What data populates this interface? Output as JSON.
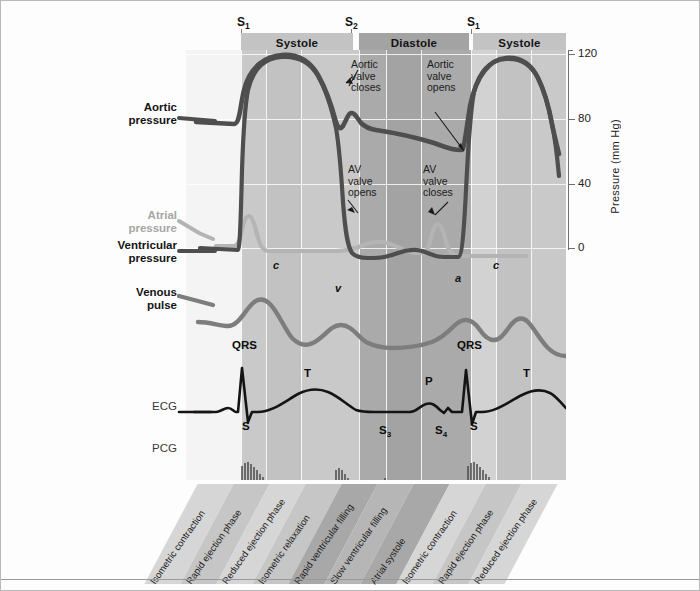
{
  "figure": {
    "axis": {
      "label": "Pressure (mm Hg)",
      "ticks": [
        "120",
        "80",
        "40",
        "0"
      ],
      "tick_values": [
        120,
        80,
        40,
        0
      ],
      "min": 0,
      "max": 120
    },
    "heart_sounds": [
      {
        "label": "S",
        "sub": "1",
        "x": 240
      },
      {
        "label": "S",
        "sub": "2",
        "x": 348
      },
      {
        "label": "S",
        "sub": "1",
        "x": 470
      }
    ],
    "phase_bar": [
      {
        "label": "Systole",
        "type": "systole",
        "x": 240,
        "w": 112
      },
      {
        "label": "Diastole",
        "type": "diastole",
        "x": 358,
        "w": 110
      },
      {
        "label": "Systole",
        "type": "systole",
        "x": 472,
        "w": 93
      }
    ],
    "traces": [
      {
        "name": "Aortic pressure",
        "label_lines": [
          "Aortic",
          "pressure"
        ],
        "style": "bold"
      },
      {
        "name": "Atrial pressure",
        "label_lines": [
          "Atrial",
          "pressure"
        ],
        "style": "muted"
      },
      {
        "name": "Ventricular pressure",
        "label_lines": [
          "Ventricular",
          "pressure"
        ],
        "style": "bold"
      },
      {
        "name": "Venous pulse",
        "label_lines": [
          "Venous",
          "pulse"
        ],
        "style": "bold"
      },
      {
        "name": "ECG",
        "label_lines": [
          "ECG"
        ],
        "style": "plain"
      },
      {
        "name": "PCG",
        "label_lines": [
          "PCG"
        ],
        "style": "plain"
      }
    ],
    "callouts": [
      {
        "lines": [
          "Aortic",
          "valve",
          "closes"
        ],
        "x": 348,
        "y": 60
      },
      {
        "lines": [
          "Aortic",
          "valve",
          "opens"
        ],
        "x": 424,
        "y": 60
      },
      {
        "lines": [
          "AV",
          "valve",
          "opens"
        ],
        "x": 345,
        "y": 165
      },
      {
        "lines": [
          "AV",
          "valve",
          "closes"
        ],
        "x": 420,
        "y": 165
      }
    ],
    "venous_marks": [
      {
        "label": "c",
        "x": 274,
        "y": 263
      },
      {
        "label": "v",
        "x": 335,
        "y": 286
      },
      {
        "label": "a",
        "x": 455,
        "y": 276
      },
      {
        "label": "c",
        "x": 494,
        "y": 263
      }
    ],
    "ecg_marks": [
      {
        "label": "QRS",
        "sub": "",
        "x": 234,
        "y": 341
      },
      {
        "label": "T",
        "sub": "",
        "x": 305,
        "y": 369
      },
      {
        "label": "P",
        "sub": "",
        "x": 425,
        "y": 377
      },
      {
        "label": "QRS",
        "sub": "",
        "x": 460,
        "y": 341
      },
      {
        "label": "T",
        "sub": "",
        "x": 524,
        "y": 369
      }
    ],
    "pcg_marks": [
      {
        "label": "S",
        "sub": "",
        "x": 243,
        "y": 422
      },
      {
        "label": "S",
        "sub": "3",
        "x": 381,
        "y": 426
      },
      {
        "label": "S",
        "sub": "4",
        "x": 437,
        "y": 426
      },
      {
        "label": "S",
        "sub": "",
        "x": 471,
        "y": 422
      }
    ],
    "cycle_phases": [
      "Isometric contraction",
      "Rapid ejection phase",
      "Reduced ejection phase",
      "Isometric relaxation",
      "Rapid ventricular filling",
      "Slow ventricular filling",
      "Atrial systole",
      "Isometric contraction",
      "Rapid ejection phase",
      "Reduced ejection phase"
    ],
    "colors": {
      "systole_band": "#c3c3c3",
      "diastole_band": "#a3a3a3",
      "plot_bg": "#f2f2f2",
      "trace_dark": "#4a4a4a",
      "trace_light": "#b2b2b2",
      "frame": "#b9b9b9"
    }
  }
}
